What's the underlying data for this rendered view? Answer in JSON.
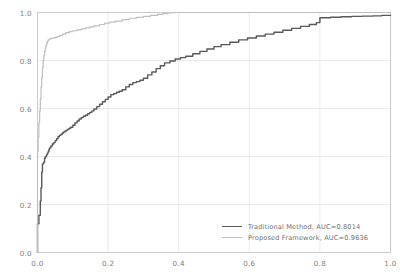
{
  "chart_data": {
    "type": "line",
    "title": "",
    "xlabel": "",
    "ylabel": "",
    "xlim": [
      0.0,
      1.0
    ],
    "ylim": [
      0.0,
      1.0
    ],
    "grid": true,
    "legend_position": "lower right",
    "background_color": "#ffffff",
    "grid_color": "#e8e8e8",
    "axis_color": "#c8c8c8",
    "xticks": [
      0.0,
      0.2,
      0.4,
      0.6,
      0.8,
      1.0
    ],
    "yticks": [
      0.0,
      0.2,
      0.4,
      0.6,
      0.8,
      1.0
    ],
    "xtick_labels": [
      "0.0",
      "0.2",
      "0.4",
      "0.6",
      "0.8",
      "1.0"
    ],
    "ytick_labels": [
      "0.0",
      "0.2",
      "0.4",
      "0.6",
      "0.8",
      "1.0"
    ],
    "series": [
      {
        "name": "Traditional Method, AUC=0.8014",
        "auc": 0.8014,
        "color": "#595959",
        "linewidth": 1.4,
        "x": [
          0.0,
          0.0,
          0.0,
          0.004,
          0.004,
          0.008,
          0.008,
          0.01,
          0.01,
          0.012,
          0.012,
          0.014,
          0.014,
          0.016,
          0.016,
          0.018,
          0.018,
          0.02,
          0.02,
          0.022,
          0.024,
          0.026,
          0.028,
          0.03,
          0.032,
          0.034,
          0.038,
          0.042,
          0.046,
          0.05,
          0.054,
          0.058,
          0.062,
          0.066,
          0.07,
          0.074,
          0.078,
          0.082,
          0.086,
          0.09,
          0.094,
          0.1,
          0.106,
          0.112,
          0.118,
          0.124,
          0.13,
          0.136,
          0.142,
          0.148,
          0.154,
          0.16,
          0.168,
          0.176,
          0.184,
          0.192,
          0.2,
          0.208,
          0.216,
          0.224,
          0.232,
          0.24,
          0.25,
          0.26,
          0.27,
          0.28,
          0.29,
          0.3,
          0.312,
          0.324,
          0.336,
          0.348,
          0.36,
          0.375,
          0.39,
          0.405,
          0.42,
          0.44,
          0.46,
          0.48,
          0.5,
          0.52,
          0.545,
          0.57,
          0.595,
          0.62,
          0.645,
          0.67,
          0.695,
          0.72,
          0.745,
          0.77,
          0.79,
          0.8,
          0.83,
          0.86,
          0.89,
          0.92,
          0.95,
          0.975,
          1.0
        ],
        "y": [
          0.0,
          0.09,
          0.12,
          0.12,
          0.155,
          0.185,
          0.215,
          0.24,
          0.27,
          0.3,
          0.335,
          0.35,
          0.368,
          0.368,
          0.372,
          0.372,
          0.376,
          0.38,
          0.392,
          0.398,
          0.402,
          0.408,
          0.414,
          0.42,
          0.428,
          0.436,
          0.444,
          0.452,
          0.458,
          0.466,
          0.474,
          0.482,
          0.488,
          0.492,
          0.498,
          0.502,
          0.506,
          0.51,
          0.514,
          0.518,
          0.522,
          0.53,
          0.54,
          0.548,
          0.556,
          0.562,
          0.568,
          0.572,
          0.578,
          0.584,
          0.59,
          0.598,
          0.608,
          0.618,
          0.628,
          0.638,
          0.648,
          0.658,
          0.662,
          0.668,
          0.672,
          0.678,
          0.69,
          0.7,
          0.708,
          0.712,
          0.718,
          0.726,
          0.74,
          0.752,
          0.766,
          0.778,
          0.79,
          0.798,
          0.806,
          0.812,
          0.818,
          0.828,
          0.838,
          0.848,
          0.858,
          0.866,
          0.876,
          0.886,
          0.894,
          0.902,
          0.91,
          0.918,
          0.926,
          0.934,
          0.942,
          0.95,
          0.958,
          0.978,
          0.98,
          0.982,
          0.984,
          0.985,
          0.986,
          0.988,
          0.99
        ]
      },
      {
        "name": "Proposed Framework, AUC=0.9636",
        "auc": 0.9636,
        "color": "#bfbfbf",
        "linewidth": 1.2,
        "x": [
          0.0,
          0.0,
          0.002,
          0.004,
          0.006,
          0.008,
          0.01,
          0.012,
          0.014,
          0.016,
          0.018,
          0.02,
          0.022,
          0.024,
          0.026,
          0.028,
          0.03,
          0.034,
          0.038,
          0.042,
          0.046,
          0.05,
          0.056,
          0.062,
          0.07,
          0.08,
          0.09,
          0.1,
          0.112,
          0.124,
          0.136,
          0.148,
          0.16,
          0.175,
          0.19,
          0.205,
          0.22,
          0.24,
          0.26,
          0.28,
          0.3,
          0.32,
          0.34,
          0.355,
          0.37,
          0.38,
          0.39,
          0.4,
          0.5,
          0.6,
          0.7,
          0.8,
          0.9,
          1.0
        ],
        "y": [
          0.0,
          0.42,
          0.48,
          0.54,
          0.59,
          0.64,
          0.69,
          0.73,
          0.77,
          0.8,
          0.82,
          0.838,
          0.852,
          0.862,
          0.872,
          0.88,
          0.886,
          0.89,
          0.892,
          0.893,
          0.894,
          0.896,
          0.9,
          0.904,
          0.91,
          0.916,
          0.92,
          0.924,
          0.928,
          0.932,
          0.936,
          0.94,
          0.944,
          0.95,
          0.956,
          0.96,
          0.964,
          0.97,
          0.976,
          0.98,
          0.984,
          0.988,
          0.992,
          0.995,
          0.998,
          0.999,
          1.0,
          1.0,
          1.0,
          1.0,
          1.0,
          1.0,
          1.0,
          1.0
        ]
      }
    ]
  },
  "legend": {
    "entries": [
      {
        "label": "Traditional Method, AUC=0.8014",
        "color": "#595959"
      },
      {
        "label": "Proposed Framework, AUC=0.9636",
        "color": "#bfbfbf"
      }
    ]
  }
}
